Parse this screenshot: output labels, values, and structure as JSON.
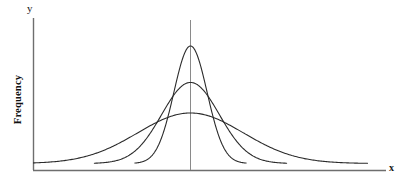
{
  "chart_data": {
    "type": "line",
    "title": "",
    "subtitle": "",
    "xlabel": "x",
    "ylabel": "Frequency",
    "y_axis_tip_label": "y",
    "grid": false,
    "legend": null,
    "annotations": [
      "vertical line at shared mean"
    ],
    "xlim": [
      0,
      100
    ],
    "ylim": [
      0,
      100
    ],
    "x_tick_labels": [],
    "y_tick_labels": [],
    "mean": 50,
    "series": [
      {
        "name": "narrow",
        "role": "tall narrow normal curve",
        "mean": 50,
        "sigma": 5.5,
        "peak_height": 100,
        "color": "#2b2b2b",
        "line_width": 1.1
      },
      {
        "name": "medium",
        "role": "medium width normal curve",
        "mean": 50,
        "sigma": 9.5,
        "peak_height": 69,
        "color": "#2b2b2b",
        "line_width": 1.1
      },
      {
        "name": "wide",
        "role": "short wide normal curve",
        "mean": 50,
        "sigma": 17.5,
        "peak_height": 43,
        "color": "#2b2b2b",
        "line_width": 1.1
      }
    ],
    "axis_color": "#6e6e6e",
    "curve_color": "#2b2b2b",
    "background_color": "#ffffff"
  },
  "axes": {
    "y_tip_label": "y",
    "x_tip_label": "x",
    "frequency_label": "Frequency"
  }
}
